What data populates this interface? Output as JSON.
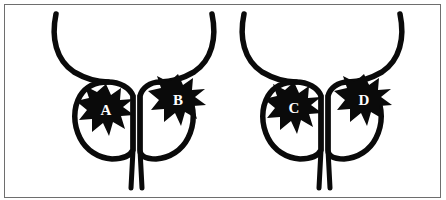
{
  "figure": {
    "background_color": "#ffffff",
    "stroke_color": "#0a0a0a",
    "border_color": "#6e6e6e",
    "label_color": "#ffffff",
    "width": 446,
    "height": 200,
    "panel_count": 2
  },
  "panels": [
    {
      "id": "panel-left",
      "name": "left-diagram",
      "lesions": [
        {
          "label": "A",
          "side": "left-lobe",
          "cx": 106,
          "cy": 110
        },
        {
          "label": "B",
          "side": "right-lobe",
          "cx": 178,
          "cy": 100
        }
      ]
    },
    {
      "id": "panel-right",
      "name": "right-diagram",
      "lesions": [
        {
          "label": "C",
          "side": "left-lobe",
          "cx": 294,
          "cy": 108
        },
        {
          "label": "D",
          "side": "right-lobe",
          "cx": 364,
          "cy": 100
        }
      ]
    }
  ],
  "labels": {
    "lesion_a": "A",
    "lesion_b": "B",
    "lesion_c": "C",
    "lesion_d": "D"
  }
}
